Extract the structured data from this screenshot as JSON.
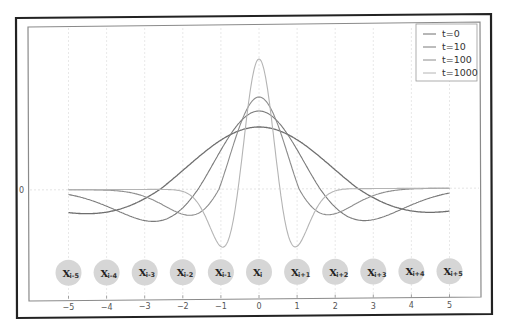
{
  "chart_data": {
    "type": "line",
    "title": "",
    "xlabel": "",
    "ylabel": "",
    "xlim": [
      -5.5,
      5.5
    ],
    "x_ticks": [
      -5,
      -4,
      -3,
      -2,
      -1,
      0,
      1,
      2,
      3,
      4,
      5
    ],
    "x_tick_labels": [
      "−5",
      "−4",
      "−3",
      "−2",
      "−1",
      "0",
      "1",
      "2",
      "3",
      "4",
      "5"
    ],
    "y_ticks": [
      0
    ],
    "y_tick_labels": [
      "0"
    ],
    "grid": true,
    "legend_position": "upper right",
    "series": [
      {
        "name": "t=0",
        "color": "#6e6e6e",
        "peak": 0.62,
        "width": 2.6,
        "trough": -0.24,
        "shape": "wide"
      },
      {
        "name": "t=10",
        "color": "#7a7a7a",
        "peak": 0.78,
        "width": 1.6,
        "trough": -0.32,
        "shape": "medium"
      },
      {
        "name": "t=100",
        "color": "#8c8c8c",
        "peak": 0.92,
        "width": 1.05,
        "trough": -0.26,
        "shape": "narrow"
      },
      {
        "name": "t=1000",
        "color": "#b4b4b4",
        "peak": 1.3,
        "width": 0.55,
        "trough": -0.58,
        "shape": "sharp"
      }
    ],
    "annotations": {
      "nodes": [
        {
          "x": -5,
          "base": "X",
          "sub": "i-5"
        },
        {
          "x": -4,
          "base": "X",
          "sub": "i-4"
        },
        {
          "x": -3,
          "base": "X",
          "sub": "i-3"
        },
        {
          "x": -2,
          "base": "X",
          "sub": "i-2"
        },
        {
          "x": -1,
          "base": "X",
          "sub": "i-1"
        },
        {
          "x": 0,
          "base": "X",
          "sub": "i"
        },
        {
          "x": 1,
          "base": "X",
          "sub": "i+1"
        },
        {
          "x": 2,
          "base": "X",
          "sub": "i+2"
        },
        {
          "x": 3,
          "base": "X",
          "sub": "i+3"
        },
        {
          "x": 4,
          "base": "X",
          "sub": "i+4"
        },
        {
          "x": 5,
          "base": "X",
          "sub": "i+5"
        }
      ]
    }
  },
  "legend": {
    "items": [
      {
        "label": "t=0"
      },
      {
        "label": "t=10"
      },
      {
        "label": "t=100"
      },
      {
        "label": "t=1000"
      }
    ]
  },
  "colors": {
    "frame": "#222222",
    "axes": "#888888",
    "grid": "#e2e2e2",
    "node_fill": "#d6d6d6"
  }
}
